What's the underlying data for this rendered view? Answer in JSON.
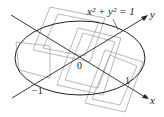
{
  "diagram": {
    "equation_label": "x² + y² = 1",
    "axes": {
      "x_label": "x",
      "y_label": "y"
    },
    "tick_labels": {
      "origin": "0",
      "neg_one": "−1",
      "one": "1"
    },
    "colors": {
      "stroke": "#222222",
      "grid": "#999999",
      "background": "#ffffff"
    }
  }
}
